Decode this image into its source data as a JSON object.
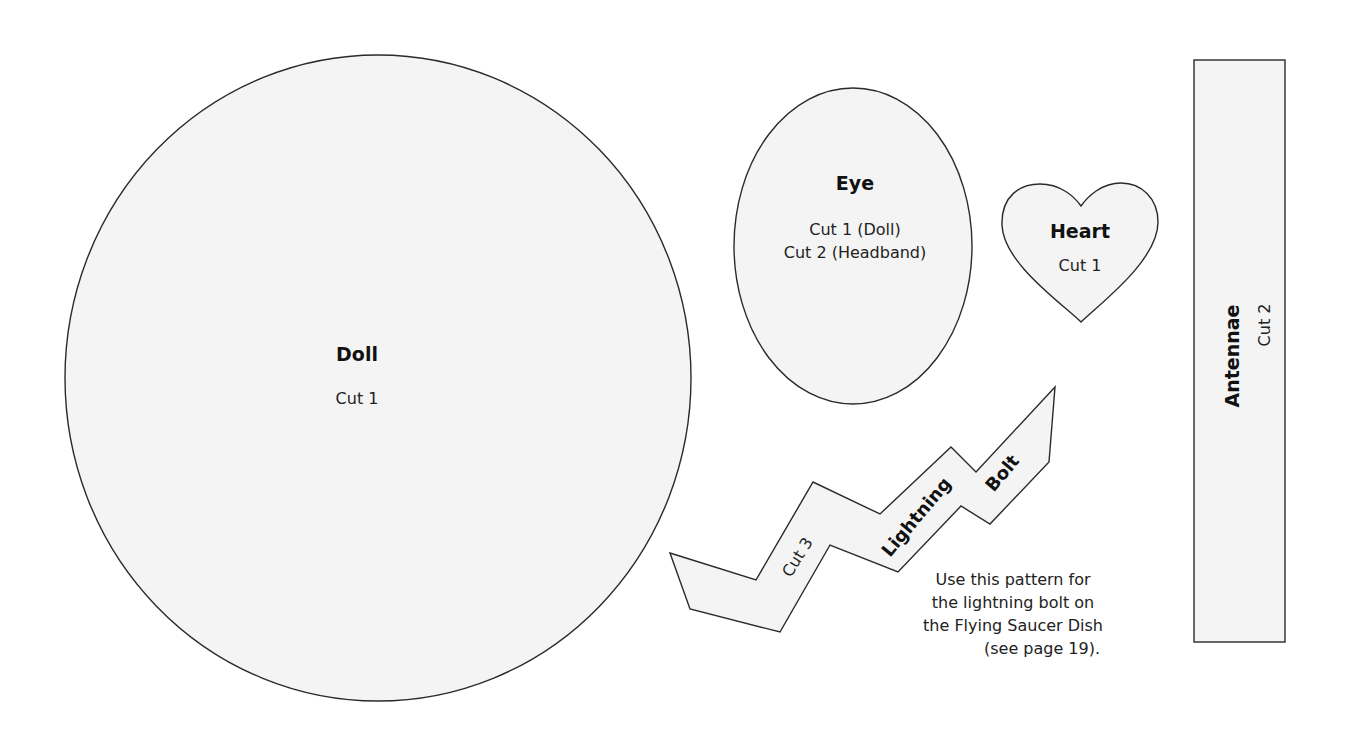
{
  "pieces": {
    "doll": {
      "name": "Doll",
      "cut": "Cut 1"
    },
    "eye": {
      "name": "Eye",
      "cut_lines": [
        "Cut 1 (Doll)",
        "Cut 2 (Headband)"
      ]
    },
    "heart": {
      "name": "Heart",
      "cut": "Cut 1"
    },
    "antennae": {
      "name": "Antennae",
      "cut": "Cut 2"
    },
    "lightning_bolt": {
      "name_words": [
        "Lightning",
        "Bolt"
      ],
      "cut": "Cut 3"
    }
  },
  "note": {
    "lines": [
      "Use this pattern for",
      "the lightning bolt on",
      "the Flying Saucer Dish",
      "(see page 19)."
    ]
  },
  "colors": {
    "piece_fill": "#f4f4f4",
    "outline": "#2a2a2a",
    "text": "#111111"
  }
}
